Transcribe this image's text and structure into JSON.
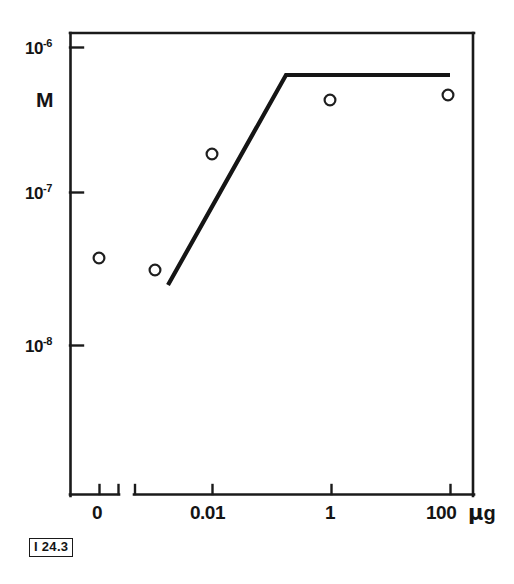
{
  "figure": {
    "id_label": "I 24.3",
    "background_color": "#ffffff",
    "ink_color": "#141414"
  },
  "chart_data": {
    "type": "scatter",
    "title": "",
    "subtitle": "",
    "xlabel": "µg",
    "ylabel": "M",
    "yscale": "log",
    "xscale": "log",
    "grid": false,
    "legend": false,
    "legend_position": "none",
    "ylim": [
      3e-09,
      1.4e-06
    ],
    "ytick_labels": [
      "10⁻⁶",
      "10⁻⁷",
      "10⁻⁸"
    ],
    "ytick_values": [
      1e-06,
      1e-07,
      1e-08
    ],
    "xtick_labels": [
      "0",
      "0.01",
      "1",
      "100"
    ],
    "xtick_values": [
      0,
      0.01,
      1,
      100
    ],
    "x_axis_break": true,
    "x_axis_break_note": "zero category plotted on a detached axis stub left of the logarithmic decade axis",
    "series": [
      {
        "name": "measured points",
        "marker": "open-circle",
        "values": [
          {
            "x_label": "0",
            "y": 4e-08
          },
          {
            "x_label": "0.0001",
            "y": 3.1e-08
          },
          {
            "x_label": "0.01",
            "y": 2.2e-07
          },
          {
            "x_label": "1",
            "y": 4.8e-07
          },
          {
            "x_label": "100",
            "y": 5e-07
          }
        ]
      },
      {
        "name": "fitted curve",
        "marker": "none",
        "style": "solid-line",
        "values": [
          {
            "x_label": "0.0004",
            "y": 2.6e-08
          },
          {
            "x_label": "0.1",
            "y": 5.6e-07
          },
          {
            "x_label": "100",
            "y": 5.6e-07
          }
        ]
      }
    ]
  },
  "axes": {
    "y_title": "M",
    "y_ticks": [
      {
        "mantissa": "10",
        "exponent": "-6"
      },
      {
        "mantissa": "10",
        "exponent": "-7"
      },
      {
        "mantissa": "10",
        "exponent": "-8"
      }
    ],
    "x_ticks": [
      "0",
      "0.01",
      "1",
      "100"
    ],
    "x_unit_mu": "μ",
    "x_unit_g": "g"
  }
}
